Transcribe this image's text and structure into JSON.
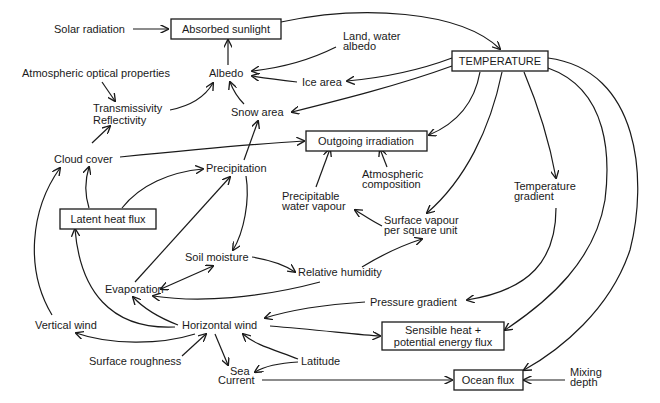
{
  "diagram": {
    "nodes": {
      "solar_radiation": "Solar radiation",
      "absorbed_sunlight": "Absorbed sunlight",
      "land_water_albedo_1": "Land, water",
      "land_water_albedo_2": "albedo",
      "temperature": "TEMPERATURE",
      "atmospheric_optical_properties": "Atmospheric optical properties",
      "albedo": "Albedo",
      "ice_area": "Ice area",
      "transmissivity": "Transmissivity",
      "reflectivity": "Reflectivity",
      "snow_area": "Snow area",
      "cloud_cover": "Cloud cover",
      "outgoing_irradiation": "Outgoing irradiation",
      "precipitation": "Precipitation",
      "atmospheric_composition_1": "Atmospheric",
      "atmospheric_composition_2": "composition",
      "temperature_gradient_1": "Temperature",
      "temperature_gradient_2": "gradient",
      "precipitable_water_vapour_1": "Precipitable",
      "precipitable_water_vapour_2": "water vapour",
      "latent_heat_flux": "Latent heat flux",
      "surface_vapour_1": "Surface vapour",
      "surface_vapour_2": "per square unit",
      "soil_moisture": "Soil moisture",
      "relative_humidity": "Relative humidity",
      "evaporation": "Evaporation",
      "pressure_gradient": "Pressure gradient",
      "vertical_wind": "Vertical wind",
      "horizontal_wind": "Horizontal wind",
      "sensible_heat_1": "Sensible heat +",
      "sensible_heat_2": "potential energy flux",
      "surface_roughness": "Surface roughness",
      "latitude": "Latitude",
      "sea_current_1": "Sea",
      "sea_current_2": "Current",
      "ocean_flux": "Ocean flux",
      "mixing_depth_1": "Mixing",
      "mixing_depth_2": "depth"
    },
    "edges": [
      {
        "from": "Solar radiation",
        "to": "Absorbed sunlight"
      },
      {
        "from": "Absorbed sunlight",
        "to": "TEMPERATURE"
      },
      {
        "from": "Albedo",
        "to": "Absorbed sunlight"
      },
      {
        "from": "Land, water albedo",
        "to": "Albedo"
      },
      {
        "from": "Ice area",
        "to": "Albedo"
      },
      {
        "from": "TEMPERATURE",
        "to": "Ice area"
      },
      {
        "from": "TEMPERATURE",
        "to": "Snow area"
      },
      {
        "from": "Snow area",
        "to": "Albedo"
      },
      {
        "from": "Atmospheric optical properties",
        "to": "Transmissivity Reflectivity"
      },
      {
        "from": "Transmissivity Reflectivity",
        "to": "Albedo"
      },
      {
        "from": "Cloud cover",
        "to": "Transmissivity Reflectivity"
      },
      {
        "from": "Cloud cover",
        "to": "Outgoing irradiation"
      },
      {
        "from": "TEMPERATURE",
        "to": "Outgoing irradiation"
      },
      {
        "from": "Atmospheric composition",
        "to": "Outgoing irradiation"
      },
      {
        "from": "Precipitable water vapour",
        "to": "Outgoing irradiation"
      },
      {
        "from": "Precipitation",
        "to": "Snow area"
      },
      {
        "from": "Precipitation",
        "to": "Soil moisture"
      },
      {
        "from": "Latent heat flux",
        "to": "Cloud cover"
      },
      {
        "from": "Latent heat flux",
        "to": "Precipitation"
      },
      {
        "from": "TEMPERATURE",
        "to": "Surface vapour per square unit"
      },
      {
        "from": "Surface vapour per square unit",
        "to": "Precipitable water vapour"
      },
      {
        "from": "TEMPERATURE",
        "to": "Temperature gradient"
      },
      {
        "from": "Temperature gradient",
        "to": "Pressure gradient"
      },
      {
        "from": "TEMPERATURE",
        "to": "Sensible heat + potential energy flux"
      },
      {
        "from": "TEMPERATURE",
        "to": "Ocean flux"
      },
      {
        "from": "Soil moisture",
        "to": "Relative humidity"
      },
      {
        "from": "Soil moisture",
        "to": "Evaporation",
        "bidirectional": true
      },
      {
        "from": "Relative humidity",
        "to": "Surface vapour per square unit"
      },
      {
        "from": "Relative humidity",
        "to": "Evaporation"
      },
      {
        "from": "Evaporation",
        "to": "Precipitation"
      },
      {
        "from": "Pressure gradient",
        "to": "Horizontal wind"
      },
      {
        "from": "Horizontal wind",
        "to": "Evaporation"
      },
      {
        "from": "Horizontal wind",
        "to": "Latent heat flux"
      },
      {
        "from": "Horizontal wind",
        "to": "Vertical wind"
      },
      {
        "from": "Horizontal wind",
        "to": "Sensible heat + potential energy flux"
      },
      {
        "from": "Horizontal wind",
        "to": "Sea Current"
      },
      {
        "from": "Vertical wind",
        "to": "Cloud cover"
      },
      {
        "from": "Surface roughness",
        "to": "Horizontal wind"
      },
      {
        "from": "Latitude",
        "to": "Horizontal wind"
      },
      {
        "from": "Latitude",
        "to": "Sea Current"
      },
      {
        "from": "Sea Current",
        "to": "Ocean flux"
      },
      {
        "from": "Mixing depth",
        "to": "Ocean flux"
      }
    ],
    "colors": {
      "ink": "#1a1a1a",
      "background": "#ffffff"
    }
  }
}
